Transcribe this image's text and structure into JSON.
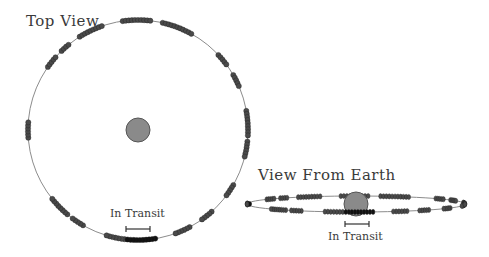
{
  "top_view": {
    "title": "Top View",
    "transit_label": "In Transit",
    "orbit": {
      "cx": 138,
      "cy": 130,
      "r": 110
    },
    "star": {
      "cx": 138,
      "cy": 130,
      "r": 12,
      "color": "#8a8a8a"
    },
    "clumps_deg": [
      {
        "start": 262,
        "end": 278,
        "dark": false
      },
      {
        "start": 283,
        "end": 300,
        "dark": false
      },
      {
        "start": 238,
        "end": 252,
        "dark": false
      },
      {
        "start": 226,
        "end": 232,
        "dark": false
      },
      {
        "start": 215,
        "end": 222,
        "dark": false
      },
      {
        "start": 176,
        "end": 184,
        "dark": false
      },
      {
        "start": 130,
        "end": 142,
        "dark": false
      },
      {
        "start": 120,
        "end": 127,
        "dark": false
      },
      {
        "start": 97,
        "end": 107,
        "dark": false
      },
      {
        "start": 81,
        "end": 96,
        "dark": true
      },
      {
        "start": 62,
        "end": 70,
        "dark": false
      },
      {
        "start": 48,
        "end": 56,
        "dark": false
      },
      {
        "start": 30,
        "end": 38,
        "dark": false
      },
      {
        "start": 6,
        "end": 14,
        "dark": false
      },
      {
        "start": -10,
        "end": 3,
        "dark": false
      },
      {
        "start": -30,
        "end": -23,
        "dark": false
      },
      {
        "start": -43,
        "end": -36,
        "dark": false
      }
    ],
    "transit_bar": {
      "x1": 126,
      "x2": 150,
      "y": 229
    }
  },
  "earth_view": {
    "title": "View From Earth",
    "transit_label": "In Transit",
    "orbit": {
      "cx": 356,
      "cy": 204,
      "rx": 109,
      "ry": 8
    },
    "star": {
      "cx": 356,
      "cy": 204,
      "r": 12,
      "color": "#8a8a8a"
    },
    "transit_bar": {
      "x1": 345,
      "x2": 369,
      "y": 224
    }
  },
  "colors": {
    "orbit_line": "#8c8c8c",
    "clump": "#4a4a4a",
    "clump_dark": "#111111",
    "text": "#3a3a3a"
  }
}
